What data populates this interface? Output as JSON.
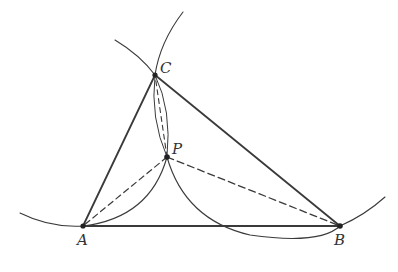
{
  "diagram": {
    "type": "geometric-construction",
    "points": {
      "A": {
        "label": "A",
        "x": 83,
        "y": 226
      },
      "B": {
        "label": "B",
        "x": 340,
        "y": 226
      },
      "C": {
        "label": "C",
        "x": 155,
        "y": 75
      },
      "P": {
        "label": "P",
        "x": 167,
        "y": 157
      }
    },
    "solid_segments": [
      "AB",
      "BC",
      "CA"
    ],
    "dashed_segments": [
      "PA",
      "PB",
      "PC"
    ],
    "colors": {
      "line": "#333333",
      "background": "#ffffff"
    }
  }
}
